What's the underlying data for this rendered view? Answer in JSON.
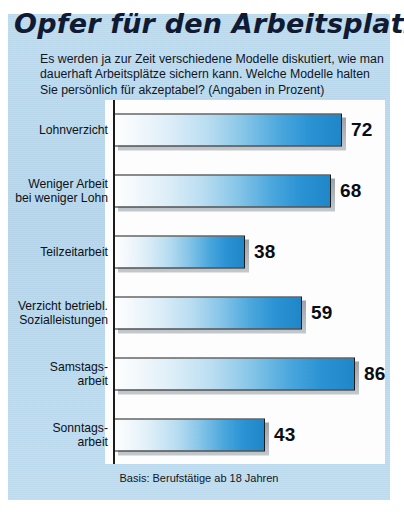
{
  "title": "Opfer für den Arbeitsplatz",
  "subtitle": "Es werden ja zur Zeit verschiedene Modelle diskutiert, wie man dauerhaft Arbeitsplätze sichern kann. Welche Modelle halten Sie persönlich für akzeptabel? (Angaben in Prozent)",
  "footer": "Basis: Berufstätige ab 18 Jahren",
  "colors": {
    "panel": "#b4d3e8",
    "plot": "#fdfdfd",
    "bar_light": "#fdfefe",
    "bar_dark": "#1f86c8",
    "outline": "#1b1b1b",
    "text": "#10161f",
    "title": "#111a33"
  },
  "chart_data": {
    "type": "bar",
    "orientation": "horizontal",
    "title": "Opfer für den Arbeitsplatz",
    "subtitle": "Es werden ja zur Zeit verschiedene Modelle diskutiert, wie man dauerhaft Arbeitsplätze sichern kann. Welche Modelle halten Sie persönlich für akzeptabel? (Angaben in Prozent)",
    "xlabel": "",
    "ylabel": "",
    "unit": "Prozent",
    "xlim": [
      0,
      100
    ],
    "grid": false,
    "legend": false,
    "note": "Basis: Berufstätige ab 18 Jahren",
    "categories": [
      "Lohnverzicht",
      "Weniger Arbeit bei weniger Lohn",
      "Teilzeitarbeit",
      "Verzicht betriebl. Sozialleistungen",
      "Samstagsarbeit",
      "Sonntagsarbeit"
    ],
    "values": [
      72,
      68,
      38,
      59,
      86,
      43
    ]
  },
  "rows": [
    {
      "label_line1": "Lohnverzicht",
      "label_line2": "",
      "value": "72",
      "bar_px": 228,
      "top": 100
    },
    {
      "label_line1": "Weniger Arbeit",
      "label_line2": "bei weniger Lohn",
      "value": "68",
      "bar_px": 217,
      "top": 161
    },
    {
      "label_line1": "Teilzeitarbeit",
      "label_line2": "",
      "value": "38",
      "bar_px": 131,
      "top": 222
    },
    {
      "label_line1": "Verzicht betriebl.",
      "label_line2": "Sozialleistungen",
      "value": "59",
      "bar_px": 188,
      "top": 283
    },
    {
      "label_line1": "Samstags-",
      "label_line2": "arbeit",
      "value": "86",
      "bar_px": 241,
      "top": 344
    },
    {
      "label_line1": "Sonntags-",
      "label_line2": "arbeit",
      "value": "43",
      "bar_px": 151,
      "top": 405
    }
  ]
}
